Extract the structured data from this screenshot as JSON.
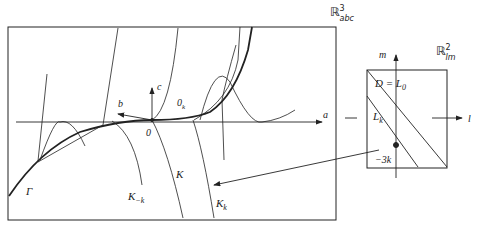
{
  "figure": {
    "left_panel": {
      "space_label": "ℝ",
      "space_sup": "3",
      "space_sub": "abc",
      "axes": {
        "a": "a",
        "b": "b",
        "c": "c"
      },
      "origin": "0",
      "origin_k": "0",
      "origin_k_sub": "k",
      "curve_gamma": "Γ",
      "curve_K": "K",
      "curve_K_minus_k": "K",
      "curve_K_minus_k_sub": "−k",
      "curve_K_k": "K",
      "curve_K_k_sub": "k"
    },
    "right_panel": {
      "space_label": "ℝ",
      "space_sup": "2",
      "space_sub": "lm",
      "axes": {
        "l": "l",
        "m": "m"
      },
      "line_D": "D = L",
      "line_D_sub": "0",
      "line_Lk": "L",
      "line_Lk_sub": "k",
      "point_label": "−3k"
    },
    "colors": {
      "ink": "#222222",
      "background": "#ffffff"
    }
  }
}
